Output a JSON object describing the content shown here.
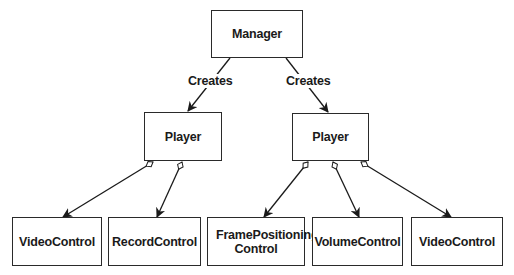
{
  "diagram": {
    "type": "class-relationship",
    "nodes": {
      "manager": "Manager",
      "player_left": "Player",
      "player_right": "Player",
      "video_control_left": "VideoControl",
      "record_control": "RecordControl",
      "frame_positioning_control": "FramePositioning Control",
      "volume_control": "VolumeControl",
      "video_control_right": "VideoControl"
    },
    "edges": [
      {
        "from": "manager",
        "to": "player_left",
        "label": "Creates",
        "style": "arrow"
      },
      {
        "from": "manager",
        "to": "player_right",
        "label": "Creates",
        "style": "arrow"
      },
      {
        "from": "player_left",
        "to": "video_control_left",
        "style": "aggregation-arrow"
      },
      {
        "from": "player_left",
        "to": "record_control",
        "style": "aggregation-arrow"
      },
      {
        "from": "player_right",
        "to": "frame_positioning_control",
        "style": "aggregation-arrow"
      },
      {
        "from": "player_right",
        "to": "volume_control",
        "style": "aggregation-arrow"
      },
      {
        "from": "player_right",
        "to": "video_control_right",
        "style": "aggregation-arrow"
      }
    ],
    "edge_labels": {
      "creates_left": "Creates",
      "creates_right": "Creates"
    },
    "colors": {
      "stroke": "#2a2a2a",
      "text": "#1a1a1a",
      "background": "#ffffff"
    }
  }
}
